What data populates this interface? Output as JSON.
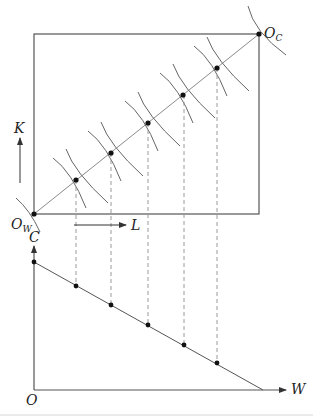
{
  "diagram": {
    "type": "edgeworth-box-with-production-possibility-frontier",
    "box": {
      "origin_bottom_left": {
        "label": "O",
        "subscript": "W",
        "x": 34,
        "y": 214
      },
      "origin_top_right": {
        "label": "O",
        "subscript": "C",
        "x": 259,
        "y": 34
      },
      "vertical_arrow_label": "K",
      "horizontal_arrow_label": "L",
      "contract_curve_points": [
        {
          "x": 76,
          "y": 180
        },
        {
          "x": 111,
          "y": 153
        },
        {
          "x": 148,
          "y": 123
        },
        {
          "x": 183,
          "y": 95
        },
        {
          "x": 217,
          "y": 68
        }
      ]
    },
    "ppf_panel": {
      "y_axis_label": "C",
      "x_axis_label": "W",
      "origin_label": "O",
      "intercept_c": {
        "x": 34,
        "y": 262
      },
      "intercept_w": {
        "x": 263,
        "y": 390
      },
      "points": [
        {
          "x": 76,
          "y": 286
        },
        {
          "x": 111,
          "y": 305
        },
        {
          "x": 148,
          "y": 325
        },
        {
          "x": 184,
          "y": 345
        },
        {
          "x": 217,
          "y": 363
        }
      ]
    },
    "colors": {
      "line": "#555555",
      "contract": "#8a8a8a",
      "dashed": "#9a9a9a",
      "dot": "#111111"
    }
  }
}
